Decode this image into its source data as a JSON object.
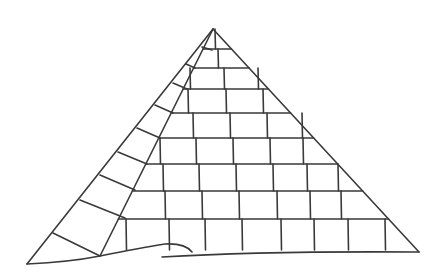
{
  "illustration": {
    "subject": "pyramid line drawing",
    "stroke_color": "#3a3a3a",
    "background_color": "#ffffff",
    "apex": [
      213,
      29
    ],
    "left_base": [
      27,
      264
    ],
    "right_base": [
      419,
      252
    ],
    "ridge_base": [
      100,
      256
    ],
    "row_lines_y": [
      49,
      68,
      89,
      113,
      138,
      164,
      191,
      219
    ],
    "row_verticals": [
      {
        "top": 29,
        "bottom": 49,
        "xs": [
          215
        ]
      },
      {
        "top": 49,
        "bottom": 68,
        "xs": [
          218
        ]
      },
      {
        "top": 68,
        "bottom": 89,
        "xs": [
          190,
          224,
          258
        ]
      },
      {
        "top": 89,
        "bottom": 113,
        "xs": [
          188,
          226,
          263
        ]
      },
      {
        "top": 113,
        "bottom": 138,
        "xs": [
          193,
          230,
          267,
          302
        ]
      },
      {
        "top": 138,
        "bottom": 164,
        "xs": [
          160,
          196,
          233,
          270,
          303
        ]
      },
      {
        "top": 164,
        "bottom": 191,
        "xs": [
          163,
          199,
          236,
          273,
          307,
          338
        ]
      },
      {
        "top": 191,
        "bottom": 219,
        "xs": [
          165,
          202,
          239,
          277,
          310,
          341
        ]
      },
      {
        "top": 219,
        "bottom": 250,
        "xs": [
          126,
          169,
          205,
          242,
          281,
          314,
          348,
          385
        ]
      }
    ],
    "left_face_divisions": [
      [
        [
          202,
          47
        ],
        [
          212,
          50
        ]
      ],
      [
        [
          186,
          64
        ],
        [
          195,
          68
        ]
      ],
      [
        [
          173,
          83
        ],
        [
          187,
          89
        ]
      ],
      [
        [
          155,
          105
        ],
        [
          173,
          113
        ]
      ],
      [
        [
          137,
          128
        ],
        [
          160,
          138
        ]
      ],
      [
        [
          118,
          152
        ],
        [
          147,
          164
        ]
      ],
      [
        [
          100,
          175
        ],
        [
          135,
          190
        ]
      ],
      [
        [
          80,
          200
        ],
        [
          125,
          218
        ]
      ],
      [
        [
          53,
          233
        ],
        [
          100,
          256
        ]
      ]
    ],
    "ground": {
      "left_path": "M27 264 Q70 262 100 256 Q140 248 165 244 Q185 243 192 252",
      "right_path": "M162 257 Q260 251 419 252"
    }
  }
}
